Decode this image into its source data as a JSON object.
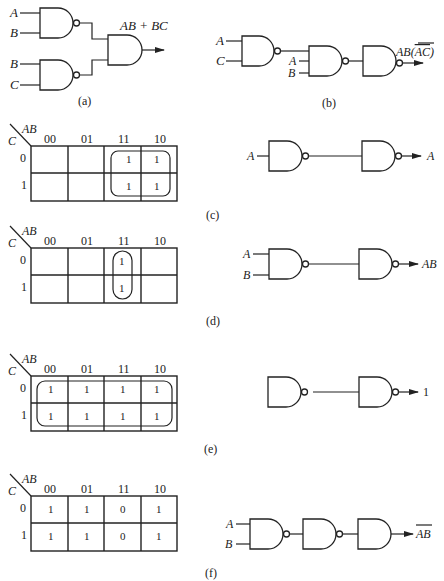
{
  "figure": {
    "panels": [
      {
        "id": "a",
        "caption": "(a)",
        "circuit": {
          "inputs": [
            [
              "A",
              "B"
            ],
            [
              "B",
              "C"
            ]
          ],
          "output_label": "AB + BC",
          "gates": [
            "NAND",
            "NAND",
            "AND"
          ]
        }
      },
      {
        "id": "b",
        "caption": "(b)",
        "circuit": {
          "inputs": [
            "A",
            "C",
            "A",
            "B"
          ],
          "output_label": "AB(AC)",
          "output_label_overbar": "AC",
          "gates": [
            "NAND",
            "NAND",
            "NAND"
          ]
        }
      },
      {
        "id": "c",
        "caption": "(c)",
        "kmap": {
          "row_var": "C",
          "col_var": "AB",
          "cols": [
            "00",
            "01",
            "11",
            "10"
          ],
          "rows": [
            "0",
            "1"
          ],
          "cells": [
            [
              "",
              "",
              "1",
              "1"
            ],
            [
              "",
              "",
              "1",
              "1"
            ]
          ],
          "group": "cols 11-10, rows 0-1"
        },
        "circuit": {
          "inputs": [
            "A"
          ],
          "output_label": "A",
          "gates": [
            "NAND",
            "NAND"
          ]
        }
      },
      {
        "id": "d",
        "caption": "(d)",
        "kmap": {
          "row_var": "C",
          "col_var": "AB",
          "cols": [
            "00",
            "01",
            "11",
            "10"
          ],
          "rows": [
            "0",
            "1"
          ],
          "cells": [
            [
              "",
              "",
              "1",
              ""
            ],
            [
              "",
              "",
              "1",
              ""
            ]
          ],
          "group": "col 11, rows 0-1"
        },
        "circuit": {
          "inputs": [
            "A",
            "B"
          ],
          "output_label": "AB",
          "gates": [
            "NAND",
            "NAND"
          ]
        }
      },
      {
        "id": "e",
        "caption": "(e)",
        "kmap": {
          "row_var": "C",
          "col_var": "AB",
          "cols": [
            "00",
            "01",
            "11",
            "10"
          ],
          "rows": [
            "0",
            "1"
          ],
          "cells": [
            [
              "1",
              "1",
              "1",
              "1"
            ],
            [
              "1",
              "1",
              "1",
              "1"
            ]
          ],
          "group": "all cells"
        },
        "circuit": {
          "inputs": [],
          "output_label": "1",
          "gates": [
            "NAND",
            "NAND"
          ]
        }
      },
      {
        "id": "f",
        "caption": "(f)",
        "kmap": {
          "row_var": "C",
          "col_var": "AB",
          "cols": [
            "00",
            "01",
            "11",
            "10"
          ],
          "rows": [
            "0",
            "1"
          ],
          "cells": [
            [
              "1",
              "1",
              "0",
              "1"
            ],
            [
              "1",
              "1",
              "0",
              "1"
            ]
          ],
          "group": "none"
        },
        "circuit": {
          "inputs": [
            "A",
            "B"
          ],
          "output_label": "AB",
          "output_label_overbar": "AB",
          "gates": [
            "NAND",
            "NAND",
            "AND"
          ]
        }
      }
    ]
  }
}
